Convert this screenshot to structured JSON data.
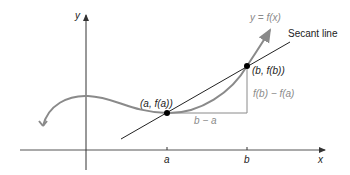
{
  "diagram": {
    "axes": {
      "x_label": "x",
      "y_label": "y"
    },
    "curve_label": "y = f(x)",
    "secant_label": "Secant line",
    "points": [
      {
        "label": "(a, f(a))"
      },
      {
        "label": "(b, f(b))"
      }
    ],
    "rise_label": "f(b) − f(a)",
    "run_label": "b − a",
    "ticks": [
      {
        "label": "a"
      },
      {
        "label": "b"
      }
    ],
    "colors": {
      "curve": "#8a8a8a",
      "axes": "#333333",
      "secant": "#222222",
      "text": "#222222"
    }
  }
}
